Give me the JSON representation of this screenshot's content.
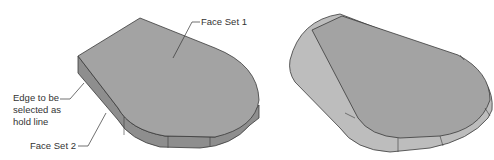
{
  "figure": {
    "left_model": {
      "labels": {
        "face_set_1": "Face Set 1",
        "edge_line1": "Edge to be",
        "edge_line2": "selected as",
        "edge_line3": "hold line",
        "face_set_2": "Face Set 2"
      }
    },
    "colors": {
      "face": "#a3a3a3",
      "side": "#8e8e8e",
      "edge": "#3a3a3a",
      "fillet": "#bdbdbd"
    }
  }
}
